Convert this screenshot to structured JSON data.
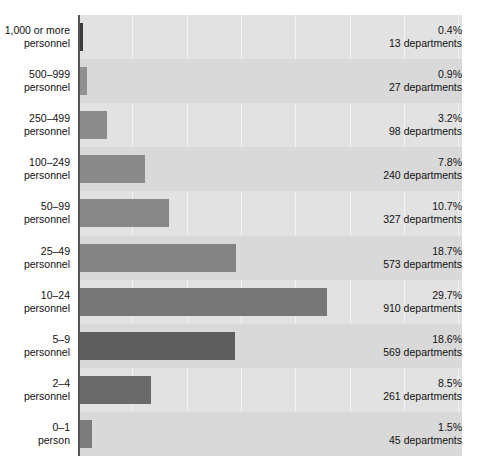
{
  "chart_data": {
    "type": "bar",
    "orientation": "horizontal",
    "title": "",
    "subtitle": "",
    "xlabel": "",
    "ylabel": "",
    "xlim": [
      0,
      46
    ],
    "grid": true,
    "gridlines_x": [
      0,
      6.5,
      13,
      19.5,
      26,
      32.5,
      39
    ],
    "legend": "none",
    "value_unit": "percent",
    "count_unit": "departments",
    "categories": [
      "1,000 or more personnel",
      "500–999 personnel",
      "250–499 personnel",
      "100–249 personnel",
      "50–99 personnel",
      "25–49 personnel",
      "10–24 personnel",
      "5–9 personnel",
      "2–4 personnel",
      "0–1 person"
    ],
    "values": [
      0.4,
      0.9,
      3.2,
      7.8,
      10.7,
      18.7,
      29.7,
      18.6,
      8.5,
      1.5
    ],
    "counts": [
      13,
      27,
      98,
      240,
      327,
      573,
      910,
      569,
      261,
      45
    ]
  },
  "rows": [
    {
      "label_line1": "1,000 or more",
      "label_line2": "personnel",
      "percent": "0.4%",
      "count": "13 departments",
      "value": 0.4,
      "color": "#3a3a3a"
    },
    {
      "label_line1": "500–999",
      "label_line2": "personnel",
      "percent": "0.9%",
      "count": "27 departments",
      "value": 0.9,
      "color": "#909090"
    },
    {
      "label_line1": "250–499",
      "label_line2": "personnel",
      "percent": "3.2%",
      "count": "98 departments",
      "value": 3.2,
      "color": "#8c8c8c"
    },
    {
      "label_line1": "100–249",
      "label_line2": "personnel",
      "percent": "7.8%",
      "count": "240 departments",
      "value": 7.8,
      "color": "#8a8a8a"
    },
    {
      "label_line1": "50–99",
      "label_line2": "personnel",
      "percent": "10.7%",
      "count": "327 departments",
      "value": 10.7,
      "color": "#878787"
    },
    {
      "label_line1": "25–49",
      "label_line2": "personnel",
      "percent": "18.7%",
      "count": "573 departments",
      "value": 18.7,
      "color": "#838383"
    },
    {
      "label_line1": "10–24",
      "label_line2": "personnel",
      "percent": "29.7%",
      "count": "910 departments",
      "value": 29.7,
      "color": "#777777"
    },
    {
      "label_line1": "5–9",
      "label_line2": "personnel",
      "percent": "18.6%",
      "count": "569 departments",
      "value": 18.6,
      "color": "#5e5e5e"
    },
    {
      "label_line1": "2–4",
      "label_line2": "personnel",
      "percent": "8.5%",
      "count": "261 departments",
      "value": 8.5,
      "color": "#6a6a6a"
    },
    {
      "label_line1": "0–1",
      "label_line2": "person",
      "percent": "1.5%",
      "count": "45 departments",
      "value": 1.5,
      "color": "#7c7c7c"
    }
  ],
  "style": {
    "plot_background": "#e2e2e2",
    "band_background": "#d9d9d9",
    "gridline_color": "#f4f4f4",
    "axis_color": "#555555",
    "text_color": "#111111",
    "page_background": "#ffffff"
  },
  "geometry": {
    "plot_left": 78,
    "plot_top": 15,
    "plot_width": 384,
    "plot_height": 441,
    "row_count": 10,
    "px_per_percent": 8.32,
    "bar_height": 28,
    "gridline_step": 54.3
  }
}
